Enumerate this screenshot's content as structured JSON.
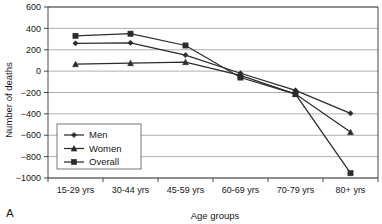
{
  "panel": {
    "label": "A"
  },
  "chart_data": {
    "type": "line",
    "title": "",
    "xlabel": "Age groups",
    "ylabel": "Number of deaths",
    "categories": [
      "15-29 yrs",
      "30-44 yrs",
      "45-59 yrs",
      "60-69 yrs",
      "70-79 yrs",
      "80+ yrs"
    ],
    "series": [
      {
        "name": "Men",
        "marker": "diamond",
        "values": [
          260,
          265,
          150,
          -20,
          -180,
          -395
        ]
      },
      {
        "name": "Women",
        "marker": "triangle",
        "values": [
          65,
          75,
          85,
          -40,
          -215,
          -570
        ]
      },
      {
        "name": "Overall",
        "marker": "square",
        "values": [
          330,
          350,
          240,
          -60,
          -215,
          -955
        ]
      }
    ],
    "ylim": [
      -1000,
      600
    ],
    "yticks": [
      600,
      400,
      200,
      0,
      -200,
      -400,
      -600,
      -800,
      -1000
    ],
    "ytick_labels": [
      "600",
      "400",
      "200",
      "0",
      "−200",
      "−400",
      "−600",
      "−800",
      "−1000"
    ],
    "grid": true,
    "legend_position": "lower-left",
    "line_color": "#2b2b2b"
  }
}
